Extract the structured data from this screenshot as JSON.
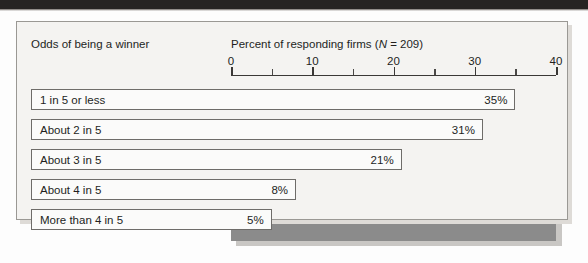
{
  "figure": {
    "left_header": "Odds of being a winner",
    "right_header_prefix": "Percent of responding firms (",
    "right_header_italic": "N",
    "right_header_suffix": " = 209)"
  },
  "colors": {
    "plot_fill": "#8b8b8b",
    "panel_fill": "#f4f3f1",
    "bar_fill": "#fbfbfa",
    "bar_border": "#6e6c69",
    "axis": "#3a3836",
    "text": "#231f1d",
    "page_band": "#262422"
  },
  "chart_data": {
    "type": "bar",
    "orientation": "horizontal",
    "title": "",
    "xlabel": "Percent of responding firms (N = 209)",
    "ylabel": "Odds of being a winner",
    "categories": [
      "1 in 5 or less",
      "About 2 in 5",
      "About 3 in 5",
      "About 4 in 5",
      "More than 4 in 5"
    ],
    "values": [
      35,
      31,
      21,
      8,
      5
    ],
    "data_labels": [
      "35%",
      "31%",
      "21%",
      "8%",
      "5%"
    ],
    "xlim": [
      0,
      40
    ],
    "xticks": [
      0,
      10,
      20,
      30,
      40
    ],
    "xtick_labels": [
      "0",
      "10",
      "20",
      "30",
      "40"
    ],
    "minor_xticks": [
      5,
      15,
      25,
      35
    ],
    "grid": false,
    "legend": null,
    "sample_size": 209
  }
}
